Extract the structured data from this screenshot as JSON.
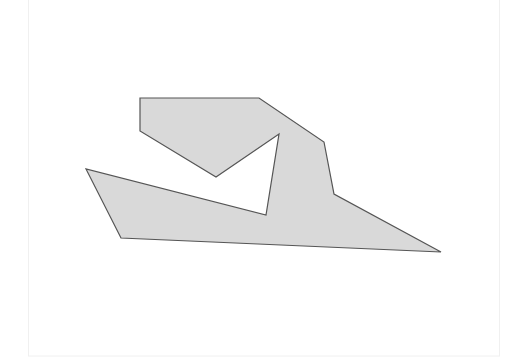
{
  "diagram": {
    "type": "polygon",
    "style": {
      "fill": "#d9d9d9",
      "stroke": "#555555",
      "stroke_width": 1.2,
      "background": "#ffffff",
      "frame_stroke": "#f0f0f0"
    },
    "frame": {
      "x": 28,
      "y": 0,
      "width": 471,
      "height": 356
    },
    "polygon": {
      "vertices": [
        [
          140,
          98
        ],
        [
          259,
          98
        ],
        [
          324,
          142
        ],
        [
          334,
          194
        ],
        [
          441,
          252
        ],
        [
          121,
          238
        ],
        [
          86,
          169
        ],
        [
          266,
          215
        ],
        [
          279,
          134
        ],
        [
          216,
          177
        ],
        [
          140,
          131
        ]
      ]
    }
  }
}
